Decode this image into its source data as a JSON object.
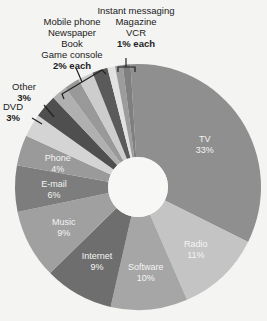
{
  "chart_data": {
    "type": "pie",
    "donut": true,
    "title": "",
    "categories": [
      "TV",
      "Radio",
      "Software",
      "Internet",
      "Music",
      "E-mail",
      "Phone",
      "DVD",
      "Other",
      "Game console",
      "Book",
      "Newspaper",
      "Mobile phone",
      "VCR",
      "Magazine",
      "Instant messaging"
    ],
    "values": [
      33,
      11,
      10,
      9,
      9,
      6,
      4,
      3,
      3,
      2,
      2,
      2,
      2,
      1,
      1,
      1
    ],
    "unit": "%",
    "colors": [
      "#8f8f8f",
      "#c4c4c4",
      "#a6a6a6",
      "#6e6e6e",
      "#a0a0a0",
      "#7d7d7d",
      "#9a9a9a",
      "#d4d4d4",
      "#4f4f4f",
      "#b0b0b0",
      "#999999",
      "#cdcdcd",
      "#5a5a5a",
      "#e2e2e2",
      "#9c9c9c",
      "#7f7f7f"
    ],
    "inside_labels": [
      {
        "name": "TV",
        "pct": "33%"
      },
      {
        "name": "Radio",
        "pct": "11%"
      },
      {
        "name": "Software",
        "pct": "10%"
      },
      {
        "name": "Internet",
        "pct": "9%"
      },
      {
        "name": "Music",
        "pct": "9%"
      },
      {
        "name": "E-mail",
        "pct": "6%"
      },
      {
        "name": "Phone",
        "pct": "4%"
      }
    ],
    "callouts": {
      "other": {
        "label": "Other",
        "pct": "3%"
      },
      "dvd": {
        "label": "DVD",
        "pct": "3%"
      },
      "two_pct_group": {
        "labels": [
          "Mobile phone",
          "Newspaper",
          "Book",
          "Game console"
        ],
        "pct": "2% each"
      },
      "one_pct_group": {
        "labels": [
          "Instant messaging",
          "Magazine",
          "VCR"
        ],
        "pct": "1% each"
      }
    }
  }
}
